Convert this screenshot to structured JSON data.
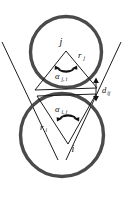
{
  "figure": {
    "background_color": "#ffffff",
    "circle_color": "#4a4a4a",
    "line_color": "#1c1c1c",
    "text_color": "#111111",
    "width": 125,
    "height": 201
  },
  "labels": {
    "node_upper": "j",
    "node_lower": "i",
    "radius_upper": "r",
    "radius_upper_sub": "j",
    "radius_lower": "r",
    "radius_lower_sub": "i",
    "angle_upper": "α",
    "angle_upper_sub": "j, i",
    "angle_lower": "α",
    "angle_lower_sub": "i, j",
    "distance": "d",
    "distance_sub": "ij"
  },
  "geometry": {
    "upper_circle": {
      "cx": 66,
      "cy": 52,
      "r": 36
    },
    "lower_circle": {
      "cx": 62,
      "cy": 135,
      "r": 42
    },
    "upper_triangle": {
      "apex_x": 66,
      "apex_y": 48,
      "left_x": 34,
      "left_y": 90,
      "right_x": 97,
      "right_y": 88
    },
    "lower_triangle": {
      "apex_x": 68,
      "apex_y": 145,
      "left_x": 37,
      "left_y": 95,
      "right_x": 96,
      "right_y": 93
    },
    "distance_arrow": {
      "x": 96,
      "y_top": 78,
      "y_bottom": 101
    }
  }
}
